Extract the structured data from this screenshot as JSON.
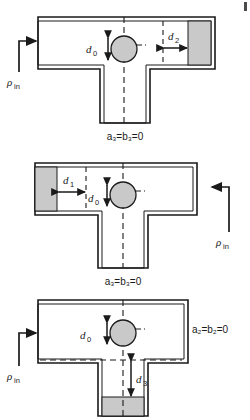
{
  "figure": {
    "panel_count": 3,
    "colors": {
      "outline": "#1a1a1a",
      "shaded_fill": "#c9c9c9",
      "circle_fill": "#c9c9c9",
      "dashed": "#1a1a1a",
      "background": "#ffffff"
    }
  },
  "panels": [
    {
      "id": "panel-top",
      "caption": "a₃=b₃=0",
      "inlet_label": "ρ",
      "inlet_sub": "in",
      "inlet_side": "left",
      "blocked_branch": "right-arm",
      "labels": [
        {
          "name": "d0",
          "base": "d",
          "sub": "0"
        },
        {
          "name": "d2",
          "base": "d",
          "sub": "2"
        }
      ]
    },
    {
      "id": "panel-middle",
      "caption": "a₃=b₃=0",
      "inlet_label": "ρ",
      "inlet_sub": "in",
      "inlet_side": "right",
      "blocked_branch": "left-arm",
      "labels": [
        {
          "name": "d0",
          "base": "d",
          "sub": "0"
        },
        {
          "name": "d1",
          "base": "d",
          "sub": "1"
        }
      ]
    },
    {
      "id": "panel-bottom",
      "caption": "",
      "side_label": "a₂=b₂=0",
      "inlet_label": "ρ",
      "inlet_sub": "in",
      "inlet_side": "left",
      "blocked_branch": "bottom-stem",
      "labels": [
        {
          "name": "d0",
          "base": "d",
          "sub": "0"
        },
        {
          "name": "d3",
          "base": "d",
          "sub": "3"
        }
      ]
    }
  ]
}
